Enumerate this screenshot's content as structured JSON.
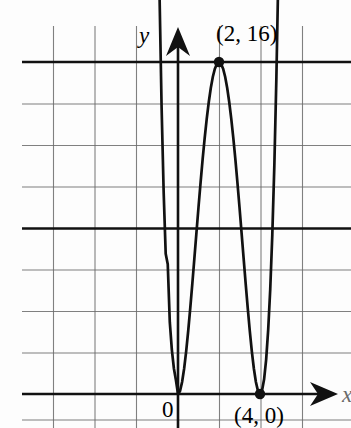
{
  "figure": {
    "kind": "coordinate-graph",
    "width": 351,
    "height": 428,
    "background_color": "#fdfdfd",
    "ink_color": "#111111",
    "grid_color": "#5d5d5d"
  },
  "axes": {
    "y_axis_label": "y",
    "x_axis_label": "x",
    "origin_label": "0",
    "x_axis_pixel_y": 394,
    "y_axis_pixel_x": 178,
    "unit_px_x": 20.5,
    "unit_px_y": 20.75,
    "grid_spacing_px": 41.5,
    "grid_units_per_square": 2
  },
  "annotations": [
    {
      "name": "local-maximum",
      "text": "(2, 16)",
      "x": 2,
      "y": 16,
      "marker": "filled-dot"
    },
    {
      "name": "right-root",
      "text": "(4, 0)",
      "x": 4,
      "y": 0,
      "marker": "filled-dot"
    },
    {
      "name": "left-root",
      "text": "",
      "x": 0,
      "y": 0,
      "marker": "none"
    }
  ],
  "chart_data": {
    "type": "line",
    "title": "",
    "xlabel": "x",
    "ylabel": "y",
    "grid": true,
    "legend": null,
    "xlim": [
      -8.7,
      8.4
    ],
    "ylim": [
      0,
      17.6
    ],
    "xticks": [
      -6,
      -4,
      -2,
      0,
      2,
      4,
      6
    ],
    "yticks": [
      0,
      2,
      4,
      6,
      8,
      10,
      12,
      14,
      16
    ],
    "series": [
      {
        "name": "y = x^2 (x - 4)^2",
        "equation": "y = x^2(x-4)^2",
        "x": [
          -0.95,
          -0.9,
          -0.8,
          -0.7,
          -0.6,
          -0.5,
          -0.4,
          -0.3,
          -0.2,
          -0.1,
          0,
          0.1,
          0.2,
          0.3,
          0.4,
          0.5,
          0.6,
          0.7,
          0.8,
          0.9,
          1.0,
          1.1,
          1.2,
          1.3,
          1.4,
          1.5,
          1.6,
          1.7,
          1.8,
          1.9,
          2.0,
          2.1,
          2.2,
          2.3,
          2.4,
          2.5,
          2.6,
          2.7,
          2.8,
          2.9,
          3.0,
          3.1,
          3.2,
          3.3,
          3.4,
          3.5,
          3.6,
          3.7,
          3.8,
          3.9,
          4.0,
          4.1,
          4.2,
          4.3,
          4.4,
          4.5,
          4.6,
          4.7,
          4.8,
          4.9,
          4.95
        ],
        "y": [
          22.87,
          19.21,
          13.82,
          9.75,
          6.76,
          6.25,
          3.46,
          2.13,
          1.23,
          0.66,
          0,
          0.15,
          0.58,
          1.23,
          2.07,
          3.06,
          4.16,
          5.33,
          6.55,
          7.78,
          9.0,
          10.18,
          11.29,
          12.32,
          13.25,
          14.06,
          14.75,
          15.29,
          15.68,
          15.92,
          16.0,
          15.92,
          15.68,
          15.29,
          14.75,
          14.06,
          13.25,
          12.32,
          11.29,
          10.18,
          9.0,
          7.78,
          6.55,
          5.33,
          4.16,
          3.06,
          2.07,
          1.23,
          0.58,
          0.15,
          0,
          0.17,
          0.71,
          1.66,
          3.1,
          5.06,
          7.67,
          11.03,
          15.28,
          20.56,
          23.6
        ]
      }
    ],
    "markers": [
      {
        "x": 2,
        "y": 16,
        "label": "(2, 16)"
      },
      {
        "x": 4,
        "y": 0,
        "label": "(4, 0)"
      },
      {
        "x": 0,
        "y": 0,
        "label": "0"
      }
    ]
  }
}
